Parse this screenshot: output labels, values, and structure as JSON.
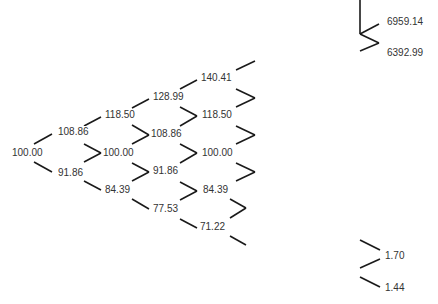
{
  "diagram": {
    "type": "binomial-tree",
    "main_tree": {
      "columns": [
        [
          "100.00"
        ],
        [
          "108.86",
          "91.86"
        ],
        [
          "118.50",
          "100.00",
          "84.39"
        ],
        [
          "128.99",
          "108.86",
          "91.86",
          "77.53"
        ],
        [
          "140.41",
          "118.50",
          "100.00",
          "84.39",
          "71.22"
        ]
      ]
    },
    "top_right": {
      "upper": "6959.14",
      "lower": "6392.99"
    },
    "bottom_right": {
      "upper": "1.70",
      "lower": "1.44"
    },
    "colors": {
      "line": "#1a1a1a",
      "text": "#333333",
      "background": "#ffffff"
    }
  }
}
